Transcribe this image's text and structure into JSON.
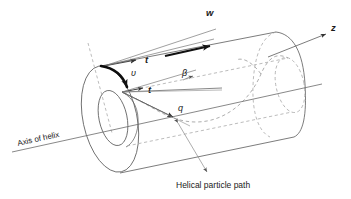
{
  "figure": {
    "title": "",
    "type": "technical-diagram"
  },
  "labels": {
    "axial_velocity": "w",
    "tangential_velocity": "υ",
    "tangent_upper": "t",
    "tangent_lower": "t",
    "resultant_velocity": "q",
    "angle_beta": "β",
    "axis_z": "z",
    "axis_of_helix": "Axis of helix",
    "helical_path": "Helical particle path"
  },
  "colors": {
    "line": "#555555",
    "dashed": "#9a9a9a",
    "vector": "#111111",
    "text": "#1a1a1a",
    "background": "#ffffff"
  },
  "geometry": {
    "outer_radius_px": 52,
    "inner_radius_px": 26,
    "cylinder_length_px": 205,
    "axis_angle_deg": -14
  }
}
